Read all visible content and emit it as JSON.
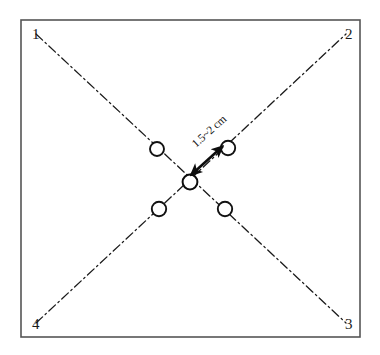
{
  "figure": {
    "type": "schematic-diagram",
    "background_color": "#ffffff",
    "line_color": "#1a1a1a",
    "frame": {
      "x": 21,
      "y": 20,
      "width": 339,
      "height": 317,
      "stroke_color": "#555555",
      "stroke_width": 1.6
    },
    "corner_labels": [
      {
        "id": "corner-1",
        "text": "1",
        "x": 32,
        "y": 39
      },
      {
        "id": "corner-2",
        "text": "2",
        "x": 345,
        "y": 39
      },
      {
        "id": "corner-3",
        "text": "3",
        "x": 345,
        "y": 329
      },
      {
        "id": "corner-4",
        "text": "4",
        "x": 32,
        "y": 329
      }
    ],
    "diagonals": [
      {
        "id": "diagonal-1-3",
        "from_label": "1",
        "to_label": "3",
        "x1": 36,
        "y1": 34,
        "x2": 346,
        "y2": 323,
        "style": "dash-dot",
        "dash_array": "9,3.5,1.6,3.5",
        "stroke_width": 1.3
      },
      {
        "id": "diagonal-4-2",
        "from_label": "4",
        "to_label": "2",
        "x1": 36,
        "y1": 323,
        "x2": 346,
        "y2": 34,
        "style": "dash-dot",
        "dash_array": "9,3.5,1.6,3.5",
        "stroke_width": 1.3
      }
    ],
    "markers": [
      {
        "id": "marker-center",
        "x": 190,
        "y": 182,
        "r": 7.4,
        "stroke_width": 2.0
      },
      {
        "id": "marker-upper-left",
        "x": 157,
        "y": 149,
        "r": 7.0,
        "stroke_width": 1.9
      },
      {
        "id": "marker-upper-right",
        "x": 228,
        "y": 148,
        "r": 7.2,
        "stroke_width": 1.9
      },
      {
        "id": "marker-lower-left",
        "x": 159,
        "y": 209,
        "r": 7.2,
        "stroke_width": 1.9
      },
      {
        "id": "marker-lower-right",
        "x": 225,
        "y": 209,
        "r": 7.2,
        "stroke_width": 1.9
      }
    ],
    "dimension_arrow": {
      "id": "spacing-arrow",
      "x1": 191,
      "y1": 175,
      "x2": 223,
      "y2": 146,
      "stroke_width": 2.6,
      "double_headed": true,
      "label": "1.5~2 cm",
      "label_x": 196,
      "label_y": 148,
      "label_rotation_deg": -42
    }
  }
}
